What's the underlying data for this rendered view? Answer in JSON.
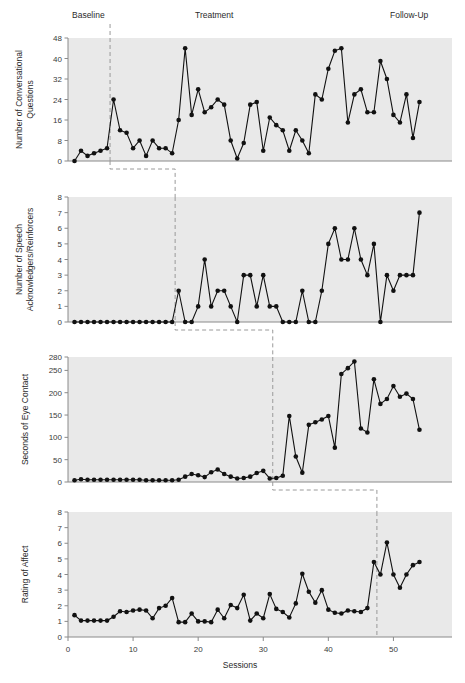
{
  "figure": {
    "phase_labels": [
      {
        "text": "Baseline",
        "x": 72,
        "y": 18
      },
      {
        "text": "Treatment",
        "x": 195,
        "y": 18
      },
      {
        "text": "Follow-Up",
        "x": 390,
        "y": 18
      }
    ],
    "xlabel": "Sessions",
    "xticks": [
      0,
      10,
      20,
      30,
      40,
      50
    ],
    "xlim": [
      0,
      59
    ],
    "panel_bg": "#e9e9e9",
    "line_color": "#111111",
    "phase_line_color": "#9a9a9a"
  },
  "chart_data": [
    {
      "type": "line",
      "title": "",
      "ylabel": "Number of Conversational Questions",
      "xlabel": "Sessions",
      "yticks": [
        0,
        8,
        16,
        24,
        32,
        40,
        48
      ],
      "ylim": [
        0,
        48
      ],
      "xlim": [
        0,
        59
      ],
      "grid": false,
      "phase_change_session": 6,
      "x": [
        1,
        2,
        3,
        4,
        5,
        6,
        7,
        8,
        9,
        10,
        11,
        12,
        13,
        14,
        15,
        16,
        17,
        18,
        19,
        20,
        21,
        22,
        23,
        24,
        25,
        26,
        27,
        28,
        29,
        30,
        31,
        32,
        33,
        34,
        35,
        36,
        37,
        38,
        39,
        40,
        41,
        42,
        43,
        44,
        45,
        46,
        47,
        48,
        49,
        50,
        51,
        52,
        53,
        54
      ],
      "values": [
        0,
        4,
        2,
        3,
        4,
        5,
        24,
        12,
        11,
        5,
        8,
        2,
        8,
        5,
        5,
        3,
        16,
        44,
        18,
        28,
        19,
        21,
        24,
        22,
        8,
        1,
        7,
        22,
        23,
        4,
        17,
        14,
        12,
        4,
        12,
        8,
        3,
        26,
        24,
        36,
        43,
        44,
        15,
        26,
        28,
        19,
        19,
        39,
        32,
        18,
        15,
        26,
        9,
        23
      ]
    },
    {
      "type": "line",
      "title": "",
      "ylabel": "Number of Speech Acknowledgers/Reinforcers",
      "xlabel": "Sessions",
      "yticks": [
        0,
        1,
        2,
        3,
        4,
        5,
        6,
        7,
        8
      ],
      "ylim": [
        0,
        8
      ],
      "xlim": [
        0,
        59
      ],
      "grid": false,
      "phase_change_session": 16,
      "x": [
        1,
        2,
        3,
        4,
        5,
        6,
        7,
        8,
        9,
        10,
        11,
        12,
        13,
        14,
        15,
        16,
        17,
        18,
        19,
        20,
        21,
        22,
        23,
        24,
        25,
        26,
        27,
        28,
        29,
        30,
        31,
        32,
        33,
        34,
        35,
        36,
        37,
        38,
        39,
        40,
        41,
        42,
        43,
        44,
        45,
        46,
        47,
        48,
        49,
        50,
        51,
        52,
        53,
        54
      ],
      "values": [
        0,
        0,
        0,
        0,
        0,
        0,
        0,
        0,
        0,
        0,
        0,
        0,
        0,
        0,
        0,
        0,
        2,
        0,
        0,
        1,
        4,
        1,
        2,
        2,
        1,
        0,
        3,
        3,
        1,
        3,
        1,
        1,
        0,
        0,
        0,
        2,
        0,
        0,
        2,
        5,
        6,
        4,
        4,
        6,
        4,
        3,
        5,
        0,
        3,
        2,
        3,
        3,
        3,
        7
      ]
    },
    {
      "type": "line",
      "title": "",
      "ylabel": "Seconds of Eye Contact",
      "xlabel": "Sessions",
      "yticks": [
        0,
        50,
        100,
        150,
        200,
        250,
        280
      ],
      "ylim": [
        0,
        280
      ],
      "xlim": [
        0,
        59
      ],
      "grid": false,
      "phase_change_session": 31,
      "x": [
        1,
        2,
        3,
        4,
        5,
        6,
        7,
        8,
        9,
        10,
        11,
        12,
        13,
        14,
        15,
        16,
        17,
        18,
        19,
        20,
        21,
        22,
        23,
        24,
        25,
        26,
        27,
        28,
        29,
        30,
        31,
        32,
        33,
        34,
        35,
        36,
        37,
        38,
        39,
        40,
        41,
        42,
        43,
        44,
        45,
        46,
        47,
        48,
        49,
        50,
        51,
        52,
        53,
        54
      ],
      "values": [
        4,
        6,
        5,
        5,
        5,
        5,
        5,
        5,
        5,
        5,
        5,
        4,
        4,
        4,
        4,
        4,
        5,
        12,
        18,
        15,
        11,
        22,
        28,
        18,
        12,
        8,
        9,
        12,
        20,
        25,
        8,
        9,
        14,
        148,
        57,
        21,
        128,
        134,
        140,
        148,
        77,
        242,
        255,
        270,
        120,
        111,
        230,
        175,
        186,
        215,
        191,
        198,
        186,
        117,
        183,
        178,
        250,
        168
      ]
    },
    {
      "type": "line",
      "title": "",
      "ylabel": "Rating of Affect",
      "xlabel": "Sessions",
      "yticks": [
        0,
        1,
        2,
        3,
        4,
        5,
        6,
        7,
        8
      ],
      "ylim": [
        0,
        8
      ],
      "xlim": [
        0,
        59
      ],
      "grid": false,
      "phase_change_session": 47,
      "x": [
        1,
        2,
        3,
        4,
        5,
        6,
        7,
        8,
        9,
        10,
        11,
        12,
        13,
        14,
        15,
        16,
        17,
        18,
        19,
        20,
        21,
        22,
        23,
        24,
        25,
        26,
        27,
        28,
        29,
        30,
        31,
        32,
        33,
        34,
        35,
        36,
        37,
        38,
        39,
        40,
        41,
        42,
        43,
        44,
        45,
        46,
        47,
        48,
        49,
        50,
        51,
        52,
        53,
        54
      ],
      "values": [
        1.4,
        1.05,
        1.05,
        1.05,
        1.05,
        1.05,
        1.3,
        1.65,
        1.6,
        1.7,
        1.75,
        1.7,
        1.2,
        1.85,
        2.0,
        2.5,
        0.95,
        0.95,
        1.5,
        1.0,
        1.0,
        0.95,
        1.75,
        1.2,
        2.05,
        1.85,
        2.7,
        1.05,
        1.5,
        1.2,
        2.75,
        1.8,
        1.6,
        1.25,
        2.15,
        4.05,
        2.9,
        2.2,
        3.0,
        1.75,
        1.55,
        1.5,
        1.7,
        1.65,
        1.6,
        1.85,
        4.8,
        4.0,
        6.05,
        4.0,
        3.15,
        4.0,
        4.6,
        4.8
      ]
    }
  ],
  "connectors": [
    {
      "from_panel": 1,
      "to_panel": 2,
      "from_session": 6,
      "to_session": 16
    },
    {
      "from_panel": 2,
      "to_panel": 3,
      "from_session": 16,
      "to_session": 31
    },
    {
      "from_panel": 3,
      "to_panel": 4,
      "from_session": 31,
      "to_session": 47
    }
  ]
}
